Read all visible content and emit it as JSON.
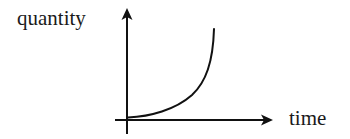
{
  "diagram": {
    "type": "exponential-growth-sketch",
    "y_axis": {
      "label": "quantity"
    },
    "x_axis": {
      "label": "time"
    },
    "curve": {
      "description": "exponential growth curve starting slightly above origin and rising steeply",
      "shape": "exponential"
    },
    "colors": {
      "stroke": "#111111",
      "background": "#ffffff"
    }
  }
}
